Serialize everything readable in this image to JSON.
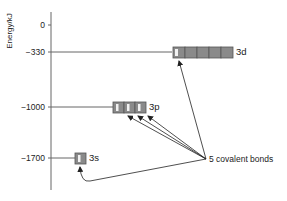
{
  "diagram": {
    "axis": {
      "label": "Energy/kJ",
      "ticks": [
        {
          "label": "0",
          "value": 0
        },
        {
          "label": "−330",
          "value": -330
        },
        {
          "label": "−1000",
          "value": -1000
        },
        {
          "label": "−1700",
          "value": -1700
        }
      ]
    },
    "levels": [
      {
        "name": "3d",
        "energy": -330,
        "orbitals": 5,
        "electrons_in_first": 1
      },
      {
        "name": "3p",
        "energy": -1000,
        "orbitals": 3,
        "electrons_each": 1
      },
      {
        "name": "3s",
        "energy": -1700,
        "orbitals": 1,
        "electrons_each": 1
      }
    ],
    "annotation": "5 covalent bonds",
    "colors": {
      "box_fill": "#8a8a8a",
      "box_border": "#555555",
      "electron": "#f2f2f2",
      "line": "#555555",
      "arrow": "#222222"
    }
  }
}
